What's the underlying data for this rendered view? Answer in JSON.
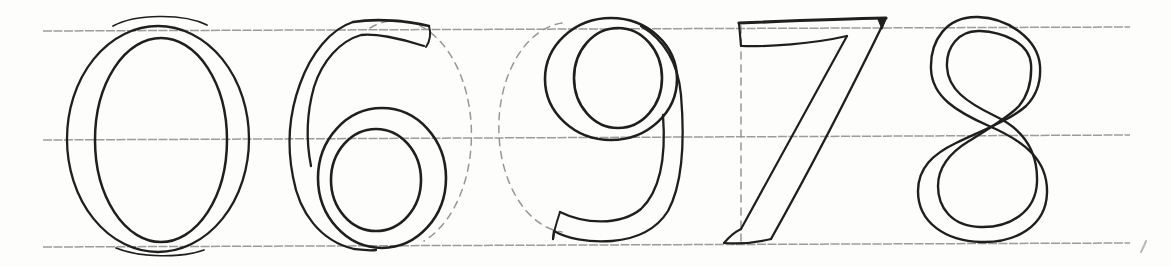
{
  "canvas": {
    "width": 1171,
    "height": 266,
    "background": "#fdfdfc"
  },
  "palette": {
    "ink": "#1f1f1f",
    "guideline": "#9c9c9c",
    "construction": "#979797",
    "faint": "#b5b5b5"
  },
  "guideline_style": {
    "width": 1.5,
    "dash": "9 1.5"
  },
  "construction_style": {
    "width": 1.5,
    "dash": "7 6"
  },
  "guidelines": [
    {
      "name": "cap-line",
      "d": "M 43,31 L 1130,27"
    },
    {
      "name": "waist-line",
      "d": "M 43,140 L 1130,135"
    },
    {
      "name": "base-line",
      "d": "M 43,247 L 1130,243"
    }
  ],
  "glyphs": [
    {
      "name": "numeral-zero",
      "label": "0",
      "strokes": [
        {
          "name": "outer-contour",
          "type": "ellipse",
          "cx": 158,
          "cy": 139,
          "rx": 91,
          "ry": 113,
          "w": 2.3
        },
        {
          "name": "inner-contour",
          "type": "ellipse",
          "cx": 161,
          "cy": 140,
          "rx": 66,
          "ry": 102,
          "w": 2.5
        },
        {
          "name": "top-retrace",
          "d": "M 113,26 C 135,14 183,13 207,25",
          "w": 1.7
        },
        {
          "name": "bottom-retrace",
          "d": "M 116,248 C 140,258 182,258 204,250",
          "w": 1.7
        }
      ]
    },
    {
      "name": "numeral-six",
      "label": "6",
      "construction": {
        "name": "circle-guide",
        "d": "M 370,28 A 71,109 0 0 1 424,241"
      },
      "strokes": [
        {
          "name": "stem-outer",
          "d": "M 353,22 C 331,29 311,53 300,84 C 289,114 287,147 293,177 C 299,212 320,241 354,249 C 362,250 369,251 376,250",
          "w": 2.3
        },
        {
          "name": "stem-inner",
          "d": "M 424,46 C 400,38 373,33 361,35 C 340,41 322,61 314,87 C 307,112 306,141 311,166",
          "w": 2.3
        },
        {
          "name": "flag-top",
          "d": "M 353,22 C 378,18 408,21 429,26",
          "w": 2.6
        },
        {
          "name": "flag-end",
          "d": "M 429,26 C 431,33 430,41 426,47",
          "w": 2.0
        },
        {
          "name": "bowl-outer",
          "type": "ellipse",
          "cx": 382,
          "cy": 178,
          "rx": 64,
          "ry": 70,
          "w": 2.6
        },
        {
          "name": "bowl-inner",
          "type": "ellipse",
          "cx": 376,
          "cy": 180,
          "rx": 45,
          "ry": 51,
          "w": 2.6
        }
      ]
    },
    {
      "name": "numeral-nine",
      "label": "9",
      "construction": {
        "name": "circle-guide",
        "d": "M 562,23 A 70,105 0 0 0 562,232"
      },
      "strokes": [
        {
          "name": "bowl-outer",
          "type": "ellipse",
          "cx": 611,
          "cy": 79,
          "rx": 66,
          "ry": 61,
          "w": 2.6
        },
        {
          "name": "bowl-inner",
          "type": "ellipse",
          "cx": 618,
          "cy": 78,
          "rx": 44,
          "ry": 50,
          "w": 2.6
        },
        {
          "name": "tail-outer",
          "d": "M 641,26 C 663,39 678,62 681,95 C 685,143 682,185 668,211 C 656,230 636,239 612,241 C 588,243 566,238 554,231 L 553,239",
          "w": 2.3
        },
        {
          "name": "tail-inner",
          "d": "M 663,115 C 666,155 661,190 641,209 C 620,226 584,224 560,212",
          "w": 2.3
        },
        {
          "name": "tail-tip",
          "d": "M 560,212 C 557,221 554,230 553,239",
          "w": 2.0
        }
      ]
    },
    {
      "name": "numeral-seven",
      "label": "7",
      "construction": {
        "name": "vertical-guide",
        "d": "M 741,26 L 741,243"
      },
      "strokes": [
        {
          "name": "bar-top",
          "d": "M 739,23 C 788,21 837,19 886,18",
          "w": 3.2
        },
        {
          "name": "diagonal-right",
          "d": "M 886,18 C 850,92 812,166 771,239",
          "w": 2.3
        },
        {
          "name": "foot-bottom",
          "d": "M 771,239 C 755,243 737,244 724,243",
          "w": 2.2
        },
        {
          "name": "foot-left",
          "d": "M 724,243 C 729,237 735,232 741,229",
          "w": 2.0
        },
        {
          "name": "diagonal-left",
          "d": "M 741,229 L 847,36",
          "w": 2.2
        },
        {
          "name": "bar-underside",
          "d": "M 847,36 C 812,44 768,47 741,46",
          "w": 2.2
        },
        {
          "name": "bar-left-end",
          "d": "M 741,46 L 739,23",
          "w": 2.2
        },
        {
          "name": "corner-serif",
          "d": "M 878,19 L 886,18 L 882,29 Z",
          "w": 1.2,
          "fill": true
        }
      ]
    },
    {
      "name": "numeral-eight",
      "label": "8",
      "strokes": [
        {
          "name": "figure-stroke-outer",
          "d": "M 978,17 C 946,16 930,41 931,69 C 932,97 957,112 989,126 C 1026,142 1048,161 1047,193 C 1046,226 1016,243 981,242 C 946,241 918,223 918,191 C 918,168 933,154 956,143 C 981,131 1012,119 1026,106 C 1037,95 1041,81 1040,66 C 1038,39 1008,18 978,17 Z",
          "w": 2.4
        },
        {
          "name": "figure-stroke-inner",
          "d": "M 980,31 C 958,30 946,48 947,67 C 948,89 966,102 995,116 C 1025,130 1038,152 1037,182 C 1036,211 1011,228 980,227 C 951,226 938,207 938,186 C 938,166 951,152 969,141 C 988,129 1009,117 1019,106 C 1029,94 1032,81 1031,64 C 1029,42 1002,32 980,31 Z",
          "w": 2.4
        }
      ]
    }
  ],
  "stray_mark": {
    "name": "stray-pen-mark",
    "d": "M 1141,252 C 1143,248 1145,244 1146,241",
    "w": 2
  }
}
